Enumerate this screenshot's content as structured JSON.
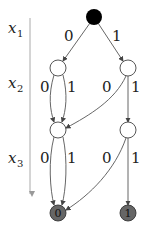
{
  "diagram": {
    "type": "binary-decision-diagram",
    "variables": [
      {
        "name": "x",
        "sub": "1"
      },
      {
        "name": "x",
        "sub": "2"
      },
      {
        "name": "x",
        "sub": "3"
      }
    ],
    "edge_labels": {
      "zero": "0",
      "one": "1"
    },
    "terminals": [
      {
        "label": "0"
      },
      {
        "label": "1"
      }
    ],
    "colors": {
      "root_fill": "#000000",
      "internal_fill": "#ffffff",
      "terminal_fill": "#666666",
      "edge": "#555555",
      "axis": "#999999"
    }
  }
}
